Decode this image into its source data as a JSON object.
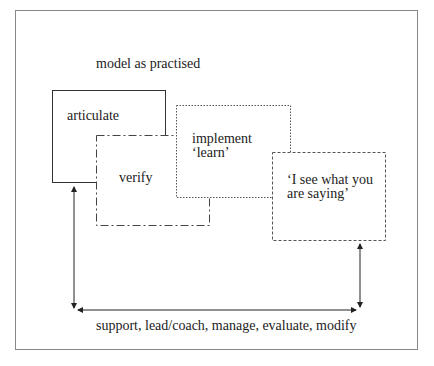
{
  "diagram": {
    "title": "model as practised",
    "boxes": [
      {
        "id": "articulate",
        "label": "articulate",
        "border": "solid"
      },
      {
        "id": "verify",
        "label": "verify",
        "border": "dash-dot"
      },
      {
        "id": "implement",
        "line1": "implement",
        "line2": "‘learn’",
        "border": "dotted"
      },
      {
        "id": "see",
        "line1": "‘I see what you",
        "line2": "are saying’",
        "border": "dashed"
      }
    ],
    "bottom_label": "support, lead/coach, manage, evaluate, modify",
    "arrows": [
      "bidirectional-left-vertical",
      "bidirectional-horizontal",
      "bidirectional-right-vertical"
    ]
  }
}
